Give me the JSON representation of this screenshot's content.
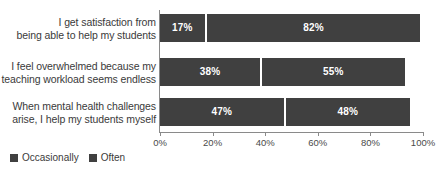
{
  "chart_data": {
    "type": "bar",
    "orientation": "horizontal",
    "stacked": true,
    "title": "",
    "subtitle": "",
    "xlabel": "",
    "ylabel": "",
    "xlim": [
      0,
      100
    ],
    "grid": false,
    "legend_position": "bottom-left",
    "categories": [
      "I get satisfaction from being able to help my students",
      "I feel overwhelmed because my teaching workload seems endless",
      "When mental health challenges arise, I help my students myself"
    ],
    "category_lines": [
      [
        "I get satisfaction from",
        "being able to help my students"
      ],
      [
        "I feel overwhelmed because my",
        "teaching workload seems endless"
      ],
      [
        "When mental health challenges",
        "arise, I help my students myself"
      ]
    ],
    "series": [
      {
        "name": "Occasionally",
        "values": [
          17,
          38,
          47
        ],
        "color": "#404040"
      },
      {
        "name": "Often",
        "values": [
          82,
          55,
          48
        ],
        "color": "#404040"
      }
    ],
    "value_labels": [
      [
        "17%",
        "82%"
      ],
      [
        "38%",
        "55%"
      ],
      [
        "47%",
        "48%"
      ]
    ],
    "xticks": [
      0,
      20,
      40,
      60,
      80,
      100
    ],
    "xtick_labels": [
      "0%",
      "20%",
      "40%",
      "60%",
      "80%",
      "100%"
    ]
  },
  "legend": {
    "items": [
      {
        "label": "Occasionally",
        "color": "#404040"
      },
      {
        "label": "Often",
        "color": "#404040"
      }
    ]
  },
  "colors": {
    "bar": "#404040",
    "axis": "#8a8a8a",
    "text": "#3a3a3a",
    "value_label": "#ffffff",
    "background": "#ffffff"
  }
}
